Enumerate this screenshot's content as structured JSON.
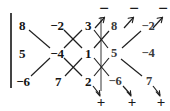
{
  "diagram": {
    "matrix_rows": 3,
    "matrix_cols": 3,
    "matrix": [
      [
        "8",
        "-2",
        "3"
      ],
      [
        "5",
        "-4",
        "1"
      ],
      [
        "-6",
        "7",
        "2"
      ]
    ],
    "repeated_columns": [
      [
        "8",
        "-2"
      ],
      [
        "5",
        "-4"
      ],
      [
        "-6",
        "7"
      ]
    ],
    "all_entries": [
      {
        "id": "r1c1",
        "text": "8",
        "row": 1,
        "col": 1,
        "x": 22,
        "y": 25,
        "repeat": false
      },
      {
        "id": "r1c2",
        "text": "−2",
        "row": 1,
        "col": 2,
        "x": 57,
        "y": 25,
        "repeat": false
      },
      {
        "id": "r1c3",
        "text": "3",
        "row": 1,
        "col": 3,
        "x": 88,
        "y": 25,
        "repeat": false
      },
      {
        "id": "r1c4",
        "text": "8",
        "row": 1,
        "col": 4,
        "x": 114,
        "y": 26,
        "repeat": true
      },
      {
        "id": "r1c5",
        "text": "−2",
        "row": 1,
        "col": 5,
        "x": 148,
        "y": 26,
        "repeat": true
      },
      {
        "id": "r2c1",
        "text": "5",
        "row": 2,
        "col": 1,
        "x": 22,
        "y": 53,
        "repeat": false
      },
      {
        "id": "r2c2",
        "text": "−4",
        "row": 2,
        "col": 2,
        "x": 57,
        "y": 53,
        "repeat": false
      },
      {
        "id": "r2c3",
        "text": "1",
        "row": 2,
        "col": 3,
        "x": 88,
        "y": 53,
        "repeat": false
      },
      {
        "id": "r2c4",
        "text": "5",
        "row": 2,
        "col": 4,
        "x": 114,
        "y": 53,
        "repeat": true
      },
      {
        "id": "r2c5",
        "text": "−4",
        "row": 2,
        "col": 5,
        "x": 148,
        "y": 53,
        "repeat": true
      },
      {
        "id": "r3c1",
        "text": "−6",
        "row": 3,
        "col": 1,
        "x": 23,
        "y": 81,
        "repeat": false
      },
      {
        "id": "r3c2",
        "text": "7",
        "row": 3,
        "col": 2,
        "x": 58,
        "y": 81,
        "repeat": false
      },
      {
        "id": "r3c3",
        "text": "2",
        "row": 3,
        "col": 3,
        "x": 88,
        "y": 81,
        "repeat": false
      },
      {
        "id": "r3c4",
        "text": "−6",
        "row": 3,
        "col": 4,
        "x": 115,
        "y": 81,
        "repeat": true
      },
      {
        "id": "r3c5",
        "text": "7",
        "row": 3,
        "col": 5,
        "x": 149,
        "y": 81,
        "repeat": true
      }
    ],
    "signs": {
      "negative_label": "−",
      "positive_label": "+",
      "negatives": [
        {
          "id": "minus-1",
          "text": "−",
          "x": 104,
          "y": 8
        },
        {
          "id": "minus-2",
          "text": "−",
          "x": 134,
          "y": 8
        },
        {
          "id": "minus-3",
          "text": "−",
          "x": 163,
          "y": 8
        }
      ],
      "positives": [
        {
          "id": "plus-1",
          "text": "+",
          "x": 101,
          "y": 102
        },
        {
          "id": "plus-2",
          "text": "+",
          "x": 132,
          "y": 102
        },
        {
          "id": "plus-3",
          "text": "+",
          "x": 161,
          "y": 102
        }
      ]
    },
    "brackets": {
      "left": {
        "x": 10,
        "top": 13,
        "height": 75,
        "color": "#444444"
      },
      "right": {
        "x": 100,
        "top": 17,
        "height": 74,
        "color": "#9a9a9a"
      }
    },
    "diagonals": {
      "downward_positive_products": [
        "8 × -4 × 2",
        "-2 × 1 × -6",
        "3 × 5 × 7"
      ],
      "upward_negative_products": [
        "-6 × -4 × 3",
        "7 × 1 × 8",
        "2 × 5 × -2"
      ]
    }
  }
}
